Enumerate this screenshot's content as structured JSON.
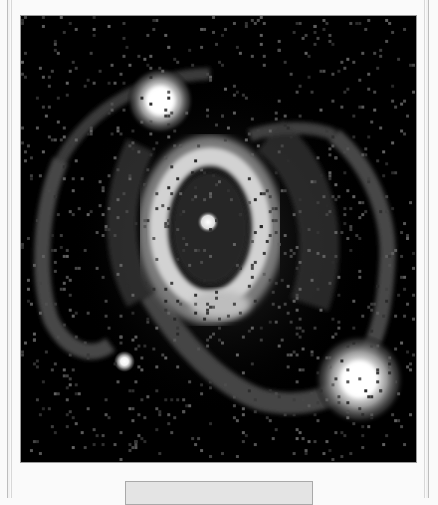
{
  "image": {
    "subject": "ring-nebula-around-central-star",
    "colors": {
      "background": "#000000",
      "outer_ring": "#4a4a4a",
      "inner_ring": "#cfcfcf",
      "star_core": "#ffffff"
    },
    "features": {
      "inner_ring": {
        "cx": 190,
        "cy": 210,
        "rx": 52,
        "ry": 72
      },
      "central_star": {
        "cx": 188,
        "cy": 207,
        "r": 8
      },
      "bright_star_top_left": {
        "cx": 140,
        "cy": 85,
        "r": 22
      },
      "bright_star_bottom_right": {
        "cx": 340,
        "cy": 365,
        "r": 28
      },
      "small_star_bottom_left": {
        "cx": 104,
        "cy": 347,
        "r": 7
      }
    }
  },
  "button": {
    "label": ""
  }
}
